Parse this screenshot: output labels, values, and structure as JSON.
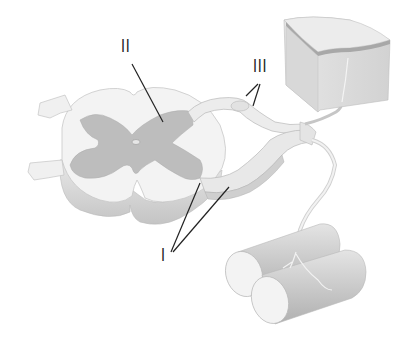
{
  "diagram": {
    "labels": [
      {
        "id": "I",
        "text": "I",
        "target": "spinal nerve roots / motor neuron"
      },
      {
        "id": "II",
        "text": "II",
        "target": "interneuron in gray matter"
      },
      {
        "id": "III",
        "text": "III",
        "target": "dorsal root ganglion / sensory neuron"
      }
    ],
    "structures": [
      {
        "name": "spinal-cord-section"
      },
      {
        "name": "gray-matter"
      },
      {
        "name": "central-canal"
      },
      {
        "name": "dorsal-root"
      },
      {
        "name": "ventral-root"
      },
      {
        "name": "spinal-nerve"
      },
      {
        "name": "skin-block"
      },
      {
        "name": "muscle-fibers"
      }
    ],
    "colors": {
      "white_matter": "#f2f2f2",
      "gray_matter": "#bdbdbd",
      "edge_shadow": "#d4d4d4",
      "skin": "#e0e0e0",
      "skin_top": "#ececec",
      "skin_band": "#a8a8a8",
      "muscle": "#cfcfcf",
      "muscle_end": "#f5f5f5",
      "leader_line": "#222222"
    }
  }
}
